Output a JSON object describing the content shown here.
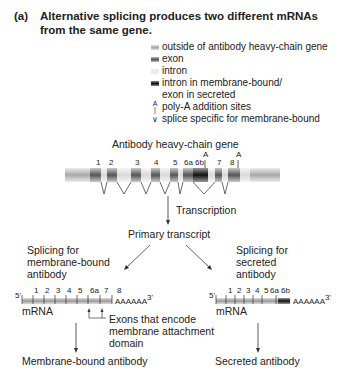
{
  "title": {
    "label": "(a)",
    "line1": "Alternative splicing produces two different mRNAs",
    "line2": "from the same gene."
  },
  "legend": {
    "items": [
      {
        "icon": "outside-swatch",
        "color": "#b8b8b8",
        "label": "outside of antibody heavy-chain gene"
      },
      {
        "icon": "exon-swatch",
        "color": "#777777",
        "label": "exon"
      },
      {
        "icon": "intron-swatch",
        "color": "#e6e6e6",
        "label": "intron"
      },
      {
        "icon": "membrane-intron-swatch",
        "color": "#222222",
        "label": "intron in membrane-bound/",
        "label2": "exon in secreted"
      },
      {
        "icon": "poly-a-icon",
        "label": "poly-A addition sites"
      },
      {
        "icon": "splice-v-icon",
        "label": "splice specific for membrane-bound"
      }
    ]
  },
  "gene": {
    "title": "Antibody heavy-chain gene",
    "exons": [
      "1",
      "2",
      "3",
      "4",
      "5",
      "6a",
      "6b",
      "7",
      "8"
    ],
    "poly_a_label": "A"
  },
  "flow": {
    "transcription": "Transcription",
    "primary": "Primary transcript",
    "left_splice": [
      "Splicing for",
      "membrane-bound",
      "antibody"
    ],
    "right_splice": [
      "Splicing for",
      "secreted",
      "antibody"
    ]
  },
  "mrna_membrane": {
    "five": "5'",
    "three": "3'",
    "tail": "AAAAAA",
    "label": "mRNA",
    "exons": [
      "1",
      "2",
      "3",
      "4",
      "5",
      "6a",
      "7",
      "8"
    ],
    "callout": [
      "Exons that encode",
      "membrane attachment",
      "domain"
    ],
    "product": "Membrane-bound antibody"
  },
  "mrna_secreted": {
    "five": "5'",
    "three": "3'",
    "tail": "AAAAAA",
    "label": "mRNA",
    "exons": [
      "1",
      "2",
      "3",
      "4",
      "5",
      "6a",
      "6b"
    ],
    "product": "Secreted antibody"
  }
}
